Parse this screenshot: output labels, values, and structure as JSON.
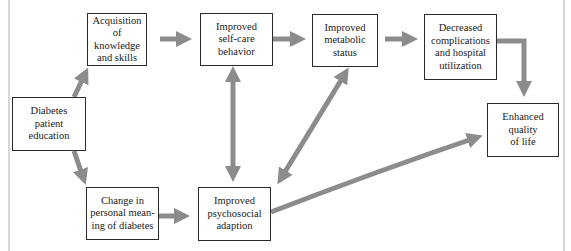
{
  "diagram": {
    "type": "flowchart",
    "title": "",
    "arrow_color": "#8c8c8c",
    "box_border_color": "#2a2a2a",
    "nodes": [
      {
        "id": "education",
        "label": "Diabetes\npatient\neducation"
      },
      {
        "id": "knowledge",
        "label": "Acquisition of\nknowledge\nand skills"
      },
      {
        "id": "selfcare",
        "label": "Improved\nself-care\nbehavior"
      },
      {
        "id": "metabolic",
        "label": "Improved\nmetabolic\nstatus"
      },
      {
        "id": "complications",
        "label": "Decreased\ncomplications\nand hospital\nutilization"
      },
      {
        "id": "quality",
        "label": "Enhanced\nquality\nof life"
      },
      {
        "id": "meaning",
        "label": "Change in\npersonal mean-\ning of diabetes"
      },
      {
        "id": "psychosocial",
        "label": "Improved\npsychosocial\nadaption"
      }
    ],
    "edges": [
      {
        "from": "education",
        "to": "knowledge",
        "direction": "forward"
      },
      {
        "from": "education",
        "to": "meaning",
        "direction": "forward"
      },
      {
        "from": "knowledge",
        "to": "selfcare",
        "direction": "forward"
      },
      {
        "from": "selfcare",
        "to": "metabolic",
        "direction": "forward"
      },
      {
        "from": "metabolic",
        "to": "complications",
        "direction": "forward"
      },
      {
        "from": "complications",
        "to": "quality",
        "direction": "forward"
      },
      {
        "from": "meaning",
        "to": "psychosocial",
        "direction": "forward"
      },
      {
        "from": "selfcare",
        "to": "psychosocial",
        "direction": "bidirectional"
      },
      {
        "from": "metabolic",
        "to": "psychosocial",
        "direction": "bidirectional"
      },
      {
        "from": "psychosocial",
        "to": "quality",
        "direction": "forward"
      }
    ]
  }
}
